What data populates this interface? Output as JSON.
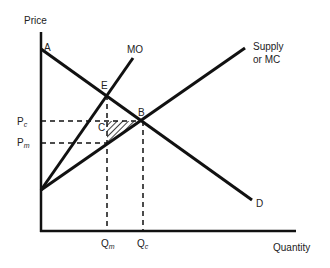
{
  "axes": {
    "y_label": "Price",
    "x_label": "Quantity"
  },
  "curves": {
    "supply_label_line1": "Supply",
    "supply_label_line2": "or MC",
    "mo_label": "MO",
    "demand_label": "D"
  },
  "points": {
    "a": "A",
    "e": "E",
    "b": "B",
    "c": "C"
  },
  "price_ticks": {
    "pc_main": "P",
    "pc_sub": "c",
    "pm_main": "P",
    "pm_sub": "m"
  },
  "quantity_ticks": {
    "qm_main": "Q",
    "qm_sub": "m",
    "qc_main": "Q",
    "qc_sub": "c"
  },
  "colors": {
    "line": "#111111",
    "text": "#222222",
    "background": "#ffffff"
  }
}
